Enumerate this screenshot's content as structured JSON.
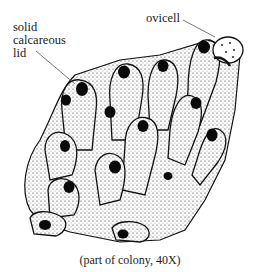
{
  "figure": {
    "labels": {
      "lid": "solid calcareous lid",
      "lid_lines": [
        "solid",
        "calcareous",
        "lid"
      ],
      "ovicell": "ovicell"
    },
    "caption": "(part of colony, 40X)",
    "colors": {
      "ink": "#111111",
      "background": "#ffffff",
      "leader_line": "#555555"
    }
  }
}
